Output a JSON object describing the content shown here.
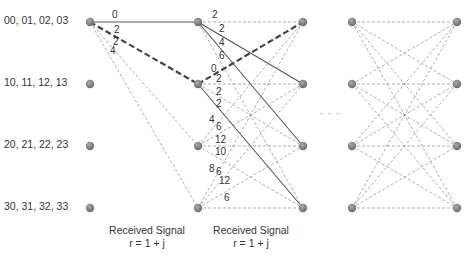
{
  "diagram": {
    "type": "trellis",
    "state_labels": [
      "00, 01, 02, 03",
      "10, 11, 12, 13",
      "20, 21, 22, 23",
      "30, 31, 32, 33"
    ],
    "stage1_branch_metrics": [
      "0",
      "2",
      "2",
      "4"
    ],
    "stage2_branch_metrics": {
      "from_state0": [
        "2",
        "2",
        "4",
        "6"
      ],
      "from_state1": [
        "0",
        "2",
        "2",
        "2"
      ],
      "from_state2": [
        "4",
        "6",
        "12",
        "10"
      ],
      "from_state3": [
        "8",
        "6",
        "12",
        "6"
      ]
    },
    "captions": [
      {
        "line1": "Received Signal",
        "line2": "r = 1 + j"
      },
      {
        "line1": "Received Signal",
        "line2": "r = 1 + j"
      }
    ],
    "ellipsis": "· · ·",
    "colors": {
      "node": "#808080",
      "solid": "#555555",
      "dashed": "#8a8a8a",
      "bold_dashed": "#444444"
    }
  }
}
